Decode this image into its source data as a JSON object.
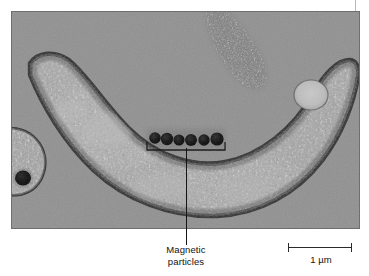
{
  "figure": {
    "type": "electron-micrograph",
    "background_color": "#ffffff"
  },
  "micrograph": {
    "cytoplasm_color": "#a5a5a5",
    "background_color": "#949494",
    "membrane_color": "#2e2e2e",
    "particle_color": "#0d0d0d",
    "vacuole_color": "#c3c3c3",
    "particle_count": 6
  },
  "annotations": {
    "particle_label": {
      "line1": "Magnetic",
      "line2": "particles"
    },
    "leader_line_color": "#141414"
  },
  "scale_bar": {
    "label": "1 µm",
    "length_um": 1,
    "color": "#2a2a2a"
  }
}
